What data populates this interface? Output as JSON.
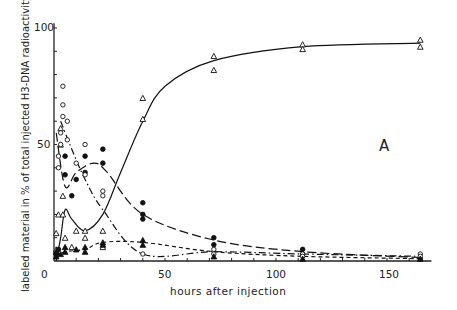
{
  "chart_data": {
    "type": "line",
    "title": "",
    "panel_label": "A",
    "xlabel": "hours after injection",
    "ylabel": "labeled material in % of total injected H3-DNA radioactivity",
    "xlim": [
      0,
      170
    ],
    "ylim": [
      0,
      100
    ],
    "x_ticks": [
      0,
      50,
      100,
      150
    ],
    "y_ticks": [
      0,
      50,
      100
    ],
    "grid": false,
    "legend": "none",
    "series": [
      {
        "name": "open triangles",
        "marker": "open-triangle",
        "line": "solid",
        "x": [
          1,
          3,
          5,
          8,
          14,
          22,
          30,
          40,
          50,
          72,
          112,
          165
        ],
        "y": [
          0,
          10,
          22,
          18,
          13,
          20,
          38,
          60,
          75,
          86,
          92,
          93.5
        ],
        "points": [
          [
            1,
            5
          ],
          [
            1,
            12
          ],
          [
            2,
            20
          ],
          [
            3,
            57
          ],
          [
            3,
            50
          ],
          [
            4,
            28
          ],
          [
            4,
            20
          ],
          [
            5,
            10
          ],
          [
            8,
            6
          ],
          [
            10,
            13
          ],
          [
            14,
            13
          ],
          [
            14,
            10
          ],
          [
            22,
            13
          ],
          [
            22,
            6
          ],
          [
            40,
            70
          ],
          [
            40,
            61
          ],
          [
            72,
            88
          ],
          [
            72,
            82
          ],
          [
            112,
            93
          ],
          [
            112,
            91
          ],
          [
            165,
            95
          ],
          [
            165,
            92
          ]
        ]
      },
      {
        "name": "filled circles",
        "marker": "filled-circle",
        "line": "long-dash",
        "x": [
          1,
          5,
          10,
          18,
          24,
          40,
          72,
          112,
          165
        ],
        "y": [
          55,
          32,
          38,
          42,
          38,
          20,
          9,
          4,
          1.5
        ],
        "points": [
          [
            1,
            3
          ],
          [
            2,
            5
          ],
          [
            5,
            45
          ],
          [
            5,
            37
          ],
          [
            8,
            28
          ],
          [
            10,
            35
          ],
          [
            14,
            45
          ],
          [
            14,
            38
          ],
          [
            22,
            48
          ],
          [
            22,
            42
          ],
          [
            40,
            25
          ],
          [
            40,
            20
          ],
          [
            40,
            18
          ],
          [
            72,
            10
          ],
          [
            72,
            7
          ],
          [
            112,
            5
          ],
          [
            112,
            3
          ],
          [
            165,
            1
          ]
        ]
      },
      {
        "name": "open circles",
        "marker": "open-circle",
        "line": "dash-dot",
        "x": [
          3,
          8,
          14,
          22,
          40,
          72,
          112,
          165
        ],
        "y": [
          60,
          48,
          35,
          22,
          3,
          4,
          3,
          2
        ],
        "points": [
          [
            2,
            40
          ],
          [
            2,
            45
          ],
          [
            3,
            50
          ],
          [
            3,
            55
          ],
          [
            4,
            62
          ],
          [
            4,
            67
          ],
          [
            4,
            75
          ],
          [
            6,
            60
          ],
          [
            6,
            52
          ],
          [
            10,
            42
          ],
          [
            14,
            50
          ],
          [
            14,
            37
          ],
          [
            22,
            30
          ],
          [
            22,
            28
          ],
          [
            40,
            3
          ],
          [
            72,
            5
          ],
          [
            72,
            3
          ],
          [
            112,
            3
          ],
          [
            112,
            2
          ],
          [
            165,
            3
          ],
          [
            165,
            2
          ]
        ]
      },
      {
        "name": "filled triangles",
        "marker": "filled-triangle",
        "line": "short-dash",
        "x": [
          1,
          5,
          14,
          22,
          40,
          72,
          112,
          165
        ],
        "y": [
          2,
          4,
          5,
          8,
          8,
          4,
          2,
          1
        ],
        "points": [
          [
            1,
            2
          ],
          [
            1,
            4
          ],
          [
            3,
            3
          ],
          [
            5,
            4
          ],
          [
            5,
            6
          ],
          [
            10,
            5
          ],
          [
            14,
            6
          ],
          [
            14,
            4
          ],
          [
            22,
            8
          ],
          [
            22,
            7
          ],
          [
            40,
            9
          ],
          [
            40,
            7
          ],
          [
            72,
            2
          ],
          [
            112,
            1
          ],
          [
            165,
            1
          ]
        ]
      }
    ]
  }
}
